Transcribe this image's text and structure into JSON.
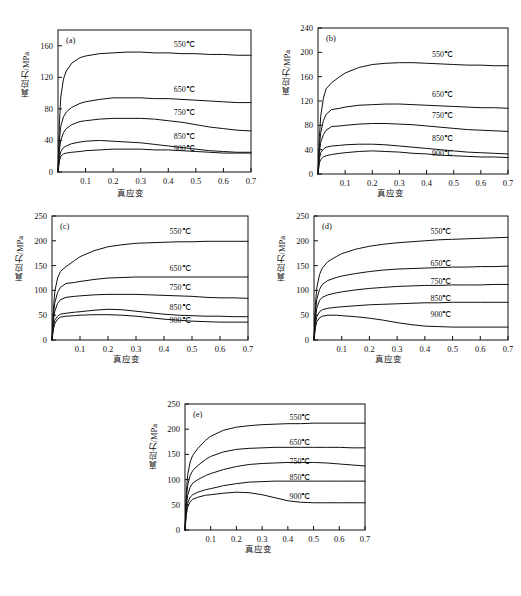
{
  "figure": {
    "axis_labels": {
      "x": "真应变",
      "y": "真应力/MPa"
    },
    "series_names": [
      "550℃",
      "650℃",
      "750℃",
      "850℃",
      "900℃"
    ],
    "panel_tags": [
      "(a)",
      "(b)",
      "(c)",
      "(d)",
      "(e)"
    ],
    "line_color": "#101010"
  },
  "chart_data": [
    {
      "type": "line",
      "panel": "(a)",
      "title": "",
      "xlabel": "真应变",
      "ylabel": "真应力/MPa",
      "xlim": [
        0,
        0.7
      ],
      "ylim": [
        0,
        180
      ],
      "xticks": [
        0.1,
        0.2,
        0.3,
        0.4,
        0.5,
        0.6,
        0.7
      ],
      "yticks": [
        0,
        40,
        80,
        120,
        160
      ],
      "grid": false,
      "legend": "inline-right-labels",
      "x": [
        0,
        0.005,
        0.01,
        0.02,
        0.03,
        0.05,
        0.08,
        0.1,
        0.15,
        0.2,
        0.25,
        0.3,
        0.35,
        0.4,
        0.45,
        0.5,
        0.55,
        0.6,
        0.65,
        0.7
      ],
      "series": [
        {
          "name": "550℃",
          "values": [
            0,
            60,
            95,
            118,
            128,
            138,
            145,
            147,
            150,
            151,
            152,
            152,
            151,
            151,
            150,
            150,
            149,
            149,
            148,
            148
          ]
        },
        {
          "name": "650℃",
          "values": [
            0,
            40,
            58,
            70,
            76,
            82,
            87,
            89,
            92,
            94,
            94,
            94,
            93,
            93,
            92,
            91,
            90,
            89,
            88,
            88
          ]
        },
        {
          "name": "750℃",
          "values": [
            0,
            28,
            40,
            50,
            55,
            60,
            64,
            65,
            67,
            68,
            68,
            68,
            67,
            65,
            63,
            60,
            57,
            55,
            53,
            52
          ]
        },
        {
          "name": "850℃",
          "values": [
            0,
            18,
            26,
            31,
            33,
            36,
            38,
            39,
            40,
            39,
            38,
            37,
            35,
            33,
            31,
            29,
            27,
            26,
            25,
            25
          ]
        },
        {
          "name": "900℃",
          "values": [
            0,
            14,
            20,
            23,
            24,
            25,
            26,
            27,
            28,
            29,
            29,
            29,
            28,
            28,
            27,
            26,
            25,
            24,
            24,
            24
          ]
        }
      ]
    },
    {
      "type": "line",
      "panel": "(b)",
      "title": "",
      "xlabel": "真应变",
      "ylabel": "真应力/MPa",
      "xlim": [
        0,
        0.7
      ],
      "ylim": [
        0,
        240
      ],
      "xticks": [
        0.1,
        0.2,
        0.3,
        0.4,
        0.5,
        0.6,
        0.7
      ],
      "yticks": [
        0,
        40,
        80,
        120,
        160,
        200,
        240
      ],
      "grid": false,
      "legend": "inline-right-labels",
      "x": [
        0,
        0.005,
        0.01,
        0.02,
        0.03,
        0.05,
        0.08,
        0.1,
        0.15,
        0.2,
        0.25,
        0.3,
        0.35,
        0.4,
        0.45,
        0.5,
        0.55,
        0.6,
        0.65,
        0.7
      ],
      "series": [
        {
          "name": "550℃",
          "values": [
            0,
            60,
            95,
            125,
            140,
            150,
            160,
            166,
            175,
            180,
            182,
            183,
            183,
            182,
            181,
            180,
            179,
            179,
            178,
            178
          ]
        },
        {
          "name": "650℃",
          "values": [
            0,
            45,
            68,
            88,
            98,
            106,
            108,
            110,
            113,
            114,
            115,
            115,
            114,
            113,
            112,
            111,
            110,
            109,
            109,
            108
          ]
        },
        {
          "name": "750℃",
          "values": [
            0,
            35,
            52,
            65,
            72,
            78,
            79,
            80,
            82,
            83,
            83,
            82,
            81,
            79,
            77,
            75,
            73,
            72,
            71,
            70
          ]
        },
        {
          "name": "850℃",
          "values": [
            0,
            25,
            35,
            41,
            44,
            46,
            47,
            48,
            49,
            49,
            48,
            46,
            44,
            42,
            40,
            38,
            36,
            35,
            34,
            33
          ]
        },
        {
          "name": "900℃",
          "values": [
            0,
            18,
            24,
            28,
            30,
            32,
            34,
            35,
            37,
            38,
            37,
            36,
            34,
            33,
            31,
            30,
            29,
            28,
            28,
            27
          ]
        }
      ]
    },
    {
      "type": "line",
      "panel": "(c)",
      "title": "",
      "xlabel": "真应变",
      "ylabel": "真应力/MPa",
      "xlim": [
        0,
        0.7
      ],
      "ylim": [
        0,
        250
      ],
      "xticks": [
        0.1,
        0.2,
        0.3,
        0.4,
        0.5,
        0.6,
        0.7
      ],
      "yticks": [
        0,
        50,
        100,
        150,
        200,
        250
      ],
      "grid": false,
      "legend": "inline-right-labels",
      "x": [
        0,
        0.005,
        0.01,
        0.02,
        0.03,
        0.05,
        0.08,
        0.1,
        0.15,
        0.2,
        0.25,
        0.3,
        0.35,
        0.4,
        0.45,
        0.5,
        0.55,
        0.6,
        0.65,
        0.7
      ],
      "series": [
        {
          "name": "550℃",
          "values": [
            0,
            62,
            98,
            125,
            138,
            148,
            160,
            168,
            180,
            188,
            192,
            195,
            196,
            197,
            198,
            198,
            199,
            199,
            199,
            199
          ]
        },
        {
          "name": "650℃",
          "values": [
            0,
            50,
            75,
            96,
            106,
            114,
            116,
            118,
            122,
            125,
            126,
            127,
            127,
            127,
            127,
            127,
            127,
            127,
            127,
            127
          ]
        },
        {
          "name": "750℃",
          "values": [
            0,
            38,
            58,
            74,
            81,
            86,
            88,
            89,
            91,
            92,
            92,
            92,
            91,
            90,
            89,
            88,
            86,
            85,
            85,
            84
          ]
        },
        {
          "name": "850℃",
          "values": [
            0,
            28,
            40,
            48,
            52,
            54,
            56,
            57,
            60,
            62,
            61,
            58,
            55,
            52,
            50,
            49,
            48,
            48,
            47,
            47
          ]
        },
        {
          "name": "900℃",
          "values": [
            0,
            22,
            33,
            42,
            46,
            48,
            49,
            50,
            51,
            51,
            50,
            48,
            45,
            42,
            40,
            38,
            37,
            36,
            36,
            36
          ]
        }
      ]
    },
    {
      "type": "line",
      "panel": "(d)",
      "title": "",
      "xlabel": "真应变",
      "ylabel": "真应力/MPa",
      "xlim": [
        0,
        0.7
      ],
      "ylim": [
        0,
        250
      ],
      "xticks": [
        0.1,
        0.2,
        0.3,
        0.4,
        0.5,
        0.6,
        0.7
      ],
      "yticks": [
        0,
        50,
        100,
        150,
        200,
        250
      ],
      "grid": false,
      "legend": "inline-right-labels",
      "x": [
        0,
        0.005,
        0.01,
        0.02,
        0.03,
        0.05,
        0.08,
        0.1,
        0.15,
        0.2,
        0.25,
        0.3,
        0.35,
        0.4,
        0.45,
        0.5,
        0.55,
        0.6,
        0.65,
        0.7
      ],
      "series": [
        {
          "name": "550℃",
          "values": [
            0,
            70,
            105,
            132,
            145,
            158,
            168,
            174,
            183,
            189,
            193,
            196,
            198,
            200,
            202,
            203,
            204,
            205,
            206,
            207
          ]
        },
        {
          "name": "650℃",
          "values": [
            0,
            55,
            82,
            102,
            112,
            120,
            126,
            129,
            134,
            138,
            141,
            143,
            144,
            145,
            146,
            147,
            147,
            148,
            148,
            149
          ]
        },
        {
          "name": "750℃",
          "values": [
            0,
            42,
            64,
            80,
            86,
            91,
            95,
            97,
            101,
            104,
            106,
            108,
            109,
            110,
            110,
            111,
            111,
            111,
            112,
            112
          ]
        },
        {
          "name": "850℃",
          "values": [
            0,
            32,
            47,
            57,
            61,
            64,
            66,
            67,
            69,
            71,
            72,
            73,
            74,
            75,
            75,
            76,
            76,
            76,
            76,
            76
          ]
        },
        {
          "name": "900℃",
          "values": [
            0,
            25,
            37,
            45,
            48,
            50,
            50,
            49,
            47,
            44,
            40,
            35,
            31,
            28,
            27,
            26,
            26,
            26,
            26,
            26
          ]
        }
      ]
    },
    {
      "type": "line",
      "panel": "(e)",
      "title": "",
      "xlabel": "真应变",
      "ylabel": "真应力/MPa",
      "xlim": [
        0,
        0.7
      ],
      "ylim": [
        0,
        250
      ],
      "xticks": [
        0.1,
        0.2,
        0.3,
        0.4,
        0.5,
        0.6,
        0.7
      ],
      "yticks": [
        0,
        50,
        100,
        150,
        200,
        250
      ],
      "grid": false,
      "legend": "inline-right-labels",
      "x": [
        0,
        0.005,
        0.01,
        0.02,
        0.03,
        0.05,
        0.08,
        0.1,
        0.15,
        0.2,
        0.25,
        0.3,
        0.35,
        0.4,
        0.45,
        0.5,
        0.55,
        0.6,
        0.65,
        0.7
      ],
      "series": [
        {
          "name": "550℃",
          "values": [
            0,
            72,
            108,
            135,
            148,
            162,
            178,
            186,
            198,
            204,
            207,
            209,
            210,
            211,
            211,
            212,
            212,
            212,
            212,
            212
          ]
        },
        {
          "name": "650℃",
          "values": [
            0,
            58,
            88,
            108,
            118,
            128,
            140,
            146,
            155,
            160,
            162,
            163,
            164,
            164,
            164,
            164,
            164,
            164,
            163,
            163
          ]
        },
        {
          "name": "750℃",
          "values": [
            0,
            45,
            68,
            85,
            93,
            100,
            108,
            112,
            120,
            126,
            130,
            132,
            133,
            134,
            134,
            134,
            133,
            131,
            129,
            127
          ]
        },
        {
          "name": "850℃",
          "values": [
            0,
            36,
            53,
            65,
            70,
            75,
            80,
            82,
            88,
            92,
            95,
            96,
            97,
            97,
            97,
            97,
            97,
            97,
            97,
            97
          ]
        },
        {
          "name": "900℃",
          "values": [
            0,
            30,
            45,
            56,
            61,
            65,
            69,
            70,
            73,
            75,
            74,
            70,
            64,
            58,
            55,
            54,
            54,
            54,
            54,
            54
          ]
        }
      ]
    }
  ]
}
